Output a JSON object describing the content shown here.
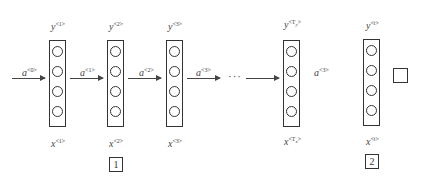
{
  "diagram": {
    "type": "rnn-unrolled",
    "cells": [
      {
        "id": 1,
        "x": 49,
        "output": {
          "base": "y",
          "sup": "<1>"
        },
        "input": {
          "base": "x",
          "sup": "<1>"
        }
      },
      {
        "id": 2,
        "x": 107,
        "output": {
          "base": "y",
          "sup": "<2>"
        },
        "input": {
          "base": "x",
          "sup": "<2>"
        }
      },
      {
        "id": 3,
        "x": 166,
        "output": {
          "base": "y",
          "sup": "<3>"
        },
        "input": {
          "base": "x",
          "sup": "<3>"
        }
      },
      {
        "id": 4,
        "x": 283,
        "output": {
          "base": "y",
          "sup_pre": "<T",
          "sub": "y",
          "sup_post": ">"
        },
        "input": {
          "base": "x",
          "sup_pre": "<T",
          "sub": "x",
          "sup_post": ">"
        }
      },
      {
        "id": 5,
        "x": 363,
        "output": {
          "base": "y",
          "sup": "<t>"
        },
        "input": {
          "base": "x",
          "sup": "<t>"
        }
      }
    ],
    "activations": [
      {
        "base": "a",
        "sup": "<0>"
      },
      {
        "base": "a",
        "sup": "<1>"
      },
      {
        "base": "a",
        "sup": "<2>"
      },
      {
        "base": "a",
        "sup": "<3>"
      },
      {
        "base": "a",
        "sup": "<3>"
      }
    ],
    "ellipsis": "···",
    "answer_boxes": [
      {
        "label": "1"
      },
      {
        "label": "2"
      }
    ],
    "blank_square": ""
  }
}
